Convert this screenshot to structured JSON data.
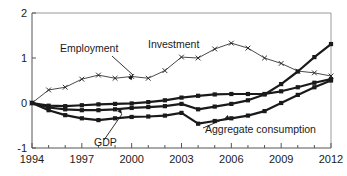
{
  "chart_data": {
    "type": "line",
    "title": "",
    "subtitle": "",
    "xlabel": "",
    "ylabel": "",
    "xlim": [
      1994,
      2012
    ],
    "ylim": [
      -1,
      2
    ],
    "grid": false,
    "legend_position": "inline-annotations",
    "x": [
      1994,
      1995,
      1996,
      1997,
      1998,
      1999,
      2000,
      2001,
      2002,
      2003,
      2004,
      2005,
      2006,
      2007,
      2008,
      2009,
      2010,
      2011,
      2012
    ],
    "x_tick_labels": [
      "1994",
      "1997",
      "2000",
      "2003",
      "2006",
      "2009",
      "2012"
    ],
    "x_tick_values": [
      1994,
      1997,
      2000,
      2003,
      2006,
      2009,
      2012
    ],
    "x_minor_ticks": [
      1995,
      1996,
      1998,
      1999,
      2001,
      2002,
      2004,
      2005,
      2007,
      2008,
      2010,
      2011
    ],
    "y_tick_labels": [
      "2",
      "1",
      "0",
      "-1"
    ],
    "y_tick_values": [
      2,
      1,
      0,
      -1
    ],
    "series": [
      {
        "name": "Investment",
        "marker": "x",
        "line_style": "thin",
        "color": "#1a1a1a",
        "values": [
          0.0,
          0.29,
          0.35,
          0.53,
          0.62,
          0.55,
          0.59,
          0.55,
          0.72,
          1.02,
          1.0,
          1.2,
          1.33,
          1.22,
          1.0,
          0.88,
          0.71,
          0.67,
          0.6
        ]
      },
      {
        "name": "Employment",
        "marker": "square",
        "line_style": "thick",
        "color": "#1a1a1a",
        "values": [
          0.0,
          -0.06,
          -0.07,
          -0.05,
          -0.03,
          -0.02,
          -0.01,
          0.02,
          0.06,
          0.12,
          0.16,
          0.19,
          0.2,
          0.2,
          0.2,
          0.26,
          0.35,
          0.45,
          0.53
        ]
      },
      {
        "name": "GDP",
        "marker": "square",
        "line_style": "thick",
        "color": "#1a1a1a",
        "values": [
          0.0,
          -0.1,
          -0.14,
          -0.16,
          -0.16,
          -0.14,
          -0.11,
          -0.09,
          -0.07,
          -0.02,
          -0.14,
          -0.08,
          -0.02,
          0.06,
          0.19,
          0.42,
          0.7,
          1.02,
          1.31
        ]
      },
      {
        "name": "Aggregate consumption",
        "marker": "square",
        "line_style": "thick",
        "color": "#1a1a1a",
        "values": [
          0.0,
          -0.16,
          -0.27,
          -0.34,
          -0.38,
          -0.34,
          -0.31,
          -0.3,
          -0.28,
          -0.22,
          -0.46,
          -0.4,
          -0.34,
          -0.28,
          -0.18,
          0.0,
          0.18,
          0.35,
          0.5
        ]
      }
    ],
    "annotations": [
      {
        "text": "Employment",
        "x_px": 60,
        "y_px": 52,
        "anchor": "start"
      },
      {
        "text": "Investment",
        "x_px": 148,
        "y_px": 48,
        "anchor": "start"
      },
      {
        "text": "GDP",
        "x_px": 94,
        "y_px": 146,
        "anchor": "start"
      },
      {
        "text": "Aggregate consumption",
        "x_px": 205,
        "y_px": 133,
        "anchor": "start"
      }
    ]
  }
}
